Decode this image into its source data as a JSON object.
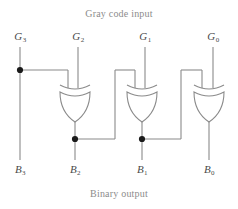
{
  "figure": {
    "title_top": "Gray code input",
    "title_bottom": "Binary output",
    "line_color": "#8a8a8a",
    "dot_color": "#1a1a1a",
    "label_color": "#4a4a4a",
    "caption_color": "#8c8c8c",
    "background": "#ffffff"
  },
  "inputs": [
    {
      "name": "G3",
      "base": "G",
      "sub": "3",
      "x": 20
    },
    {
      "name": "G2",
      "base": "G",
      "sub": "2",
      "x": 78
    },
    {
      "name": "G1",
      "base": "G",
      "sub": "1",
      "x": 145
    },
    {
      "name": "G0",
      "base": "G",
      "sub": "0",
      "x": 213
    }
  ],
  "outputs": [
    {
      "name": "B3",
      "base": "B",
      "sub": "3",
      "x": 20
    },
    {
      "name": "B2",
      "base": "B",
      "sub": "2",
      "x": 75
    },
    {
      "name": "B1",
      "base": "B",
      "sub": "1",
      "x": 142
    },
    {
      "name": "B0",
      "base": "B",
      "sub": "0",
      "x": 209
    }
  ],
  "gates": [
    {
      "name": "xor-gate-1",
      "type": "XOR",
      "output": "B2"
    },
    {
      "name": "xor-gate-2",
      "type": "XOR",
      "output": "B1"
    },
    {
      "name": "xor-gate-3",
      "type": "XOR",
      "output": "B0"
    }
  ],
  "junctions": [
    {
      "name": "junction-g3",
      "x": 20,
      "y": 70
    },
    {
      "name": "junction-b2",
      "x": 75,
      "y": 139
    },
    {
      "name": "junction-b1",
      "x": 142,
      "y": 139
    }
  ]
}
